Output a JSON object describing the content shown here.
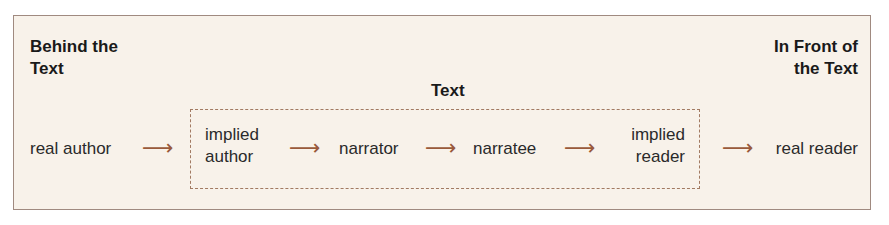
{
  "headers": {
    "behind": [
      "Behind the",
      "Text"
    ],
    "text": "Text",
    "front": [
      "In Front of",
      "the Text"
    ]
  },
  "nodes": {
    "real_author": "real author",
    "implied_author": [
      "implied",
      "author"
    ],
    "narrator": "narrator",
    "narratee": "narratee",
    "implied_reader": [
      "implied",
      "reader"
    ],
    "real_reader": "real reader"
  },
  "arrow_glyph": "⟶",
  "colors": {
    "panel_bg": "#f8f2ea",
    "panel_border": "#a08a80",
    "arrow": "#9a5a3a",
    "dashed_border": "#a27a62"
  }
}
